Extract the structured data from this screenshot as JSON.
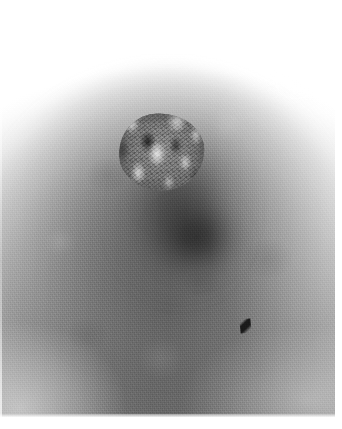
{
  "image": {
    "kind": "clinical-photograph",
    "modality": "photograph",
    "color_mode": "grayscale",
    "width_px": 342,
    "height_px": 429,
    "alt_text": "Grayscale close-up clinical photograph of a breast showing the nipple and areola with a central crusted, eroded lesion",
    "caption": ""
  },
  "subject": {
    "region": "breast nipple and areola",
    "view": "frontal close-up",
    "findings": [
      "central crusted eroded nipple surface",
      "irregular granular crust with pale nodular flecks and dark fissures",
      "darkly pigmented areola surrounding the lesion",
      "shadow pooling beneath the raised nipple",
      "small dark hair-like fleck on the lower right areola"
    ]
  },
  "regions": [
    {
      "id": "background-upper",
      "label": "bright background above breast",
      "tone": "near-white"
    },
    {
      "id": "areola",
      "label": "pigmented areola",
      "tone": "mid-dark-gray"
    },
    {
      "id": "lesion",
      "label": "central crusted lesion",
      "tone": "mottled light and dark"
    },
    {
      "id": "nipple-shadow",
      "label": "shadow below nipple",
      "tone": "dark-gray"
    },
    {
      "id": "breast-skin",
      "label": "surrounding breast skin",
      "tone": "mid-gray"
    },
    {
      "id": "hair-fleck",
      "label": "dark fleck on lower right areola",
      "tone": "near-black"
    }
  ],
  "palette": {
    "paper_white": "#ffffff",
    "highlight": "#f5f5f5",
    "skin_light": "#c9c9c9",
    "skin_mid": "#8b8b8b",
    "areola_dark": "#5a5a5a",
    "shadow_deep": "#2b2b2b",
    "fleck_black": "#141414",
    "crust_light": "#e8e8e8"
  },
  "borders": {
    "bottom_label": "white print margin (bottom)",
    "right_label": "white print margin (right)",
    "top_label": "white print hairline (top)",
    "left_label": "white print hairline (left)"
  }
}
